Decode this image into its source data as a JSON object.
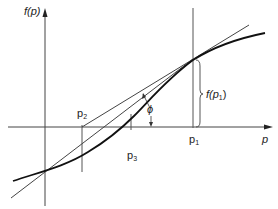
{
  "diagram": {
    "axes": {
      "y_label": "f(p)",
      "x_label": "p"
    },
    "points": [
      {
        "id": "p1",
        "label": "p",
        "sub": "1"
      },
      {
        "id": "p2",
        "label": "p",
        "sub": "2"
      },
      {
        "id": "p3",
        "label": "p",
        "sub": "3"
      }
    ],
    "annotations": {
      "angle_label": "ϕ",
      "bracket_label_prefix": "f(p",
      "bracket_label_sub": "1",
      "bracket_label_suffix": ")"
    },
    "colors": {
      "ink": "#222222",
      "thin_line": "#555555",
      "curve": "#111111"
    }
  }
}
